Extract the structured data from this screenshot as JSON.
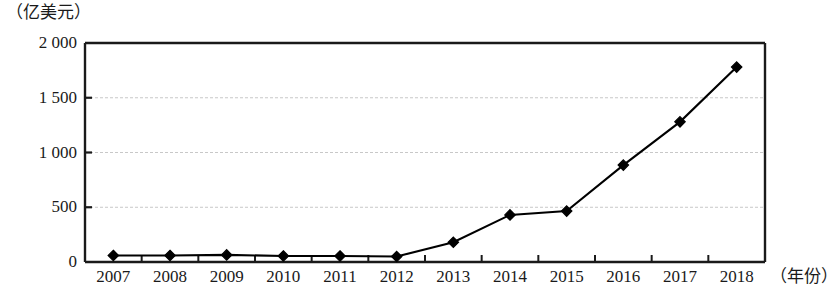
{
  "chart_data": {
    "type": "line",
    "title": "",
    "subtitle": "",
    "xlabel": "（年份）",
    "ylabel": "（亿美元）",
    "categories": [
      "2007",
      "2008",
      "2009",
      "2010",
      "2011",
      "2012",
      "2013",
      "2014",
      "2015",
      "2016",
      "2017",
      "2018"
    ],
    "values": [
      60,
      60,
      65,
      55,
      55,
      50,
      180,
      430,
      465,
      885,
      1280,
      1780
    ],
    "series": [
      {
        "name": "",
        "values": [
          60,
          60,
          65,
          55,
          55,
          50,
          180,
          430,
          465,
          885,
          1280,
          1780
        ]
      }
    ],
    "ylim": [
      0,
      2000
    ],
    "ytick_labels": [
      "0",
      "500",
      "1 000",
      "1 500",
      "2 000"
    ],
    "ytick_values": [
      0,
      500,
      1000,
      1500,
      2000
    ],
    "grid": "horizontal",
    "legend": "none",
    "marker": "diamond",
    "line_color": "#000000",
    "marker_color": "#000000",
    "grid_color": "#c8c8c8",
    "axis_color": "#1a1a1a"
  },
  "axes": {
    "y_unit_caption": "（亿美元）",
    "x_unit_caption": "（年份）"
  }
}
